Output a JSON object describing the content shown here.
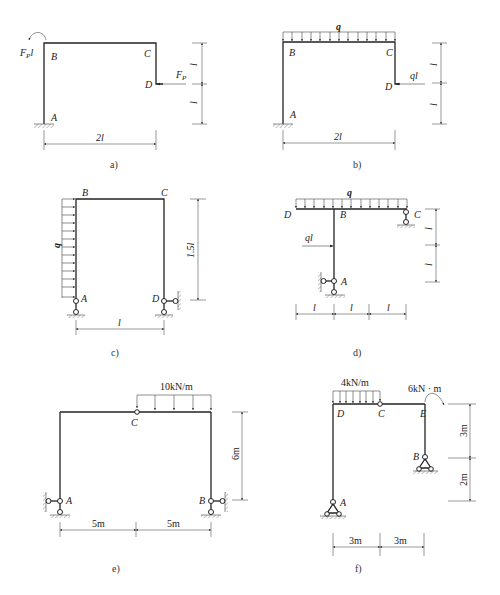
{
  "figures": [
    {
      "id": "a",
      "caption": "a)",
      "nodes": {
        "A": "A",
        "B": "B",
        "C": "C",
        "D": "D"
      },
      "loads": {
        "moment": "FPl",
        "moment_main": "F",
        "moment_sub": "P",
        "moment_tail": "l",
        "force_main": "F",
        "force_sub": "P"
      },
      "dims": {
        "horizontal": "2l",
        "vertical_upper": "l",
        "vertical_lower": "l"
      }
    },
    {
      "id": "b",
      "caption": "b)",
      "nodes": {
        "A": "A",
        "B": "B",
        "C": "C",
        "D": "D"
      },
      "loads": {
        "distributed": "q",
        "force": "ql"
      },
      "dims": {
        "horizontal": "2l",
        "vertical_upper": "l",
        "vertical_lower": "l"
      }
    },
    {
      "id": "c",
      "caption": "c)",
      "nodes": {
        "A": "A",
        "B": "B",
        "C": "C",
        "D": "D"
      },
      "loads": {
        "distributed": "q"
      },
      "dims": {
        "horizontal": "l",
        "vertical": "1.5l"
      }
    },
    {
      "id": "d",
      "caption": "d)",
      "nodes": {
        "A": "A",
        "B": "B",
        "C": "C",
        "D": "D"
      },
      "loads": {
        "distributed": "q",
        "force": "ql"
      },
      "dims": {
        "horizontal": [
          "l",
          "l",
          "l"
        ],
        "vertical_upper": "l",
        "vertical_lower": "l"
      }
    },
    {
      "id": "e",
      "caption": "e)",
      "nodes": {
        "A": "A",
        "B": "B",
        "C": "C"
      },
      "loads": {
        "distributed": "10kN/m"
      },
      "dims": {
        "horizontal": [
          "5m",
          "5m"
        ],
        "vertical": "6m"
      }
    },
    {
      "id": "f",
      "caption": "f)",
      "nodes": {
        "A": "A",
        "B": "B",
        "C": "C",
        "D": "D",
        "E": "E"
      },
      "loads": {
        "distributed": "4kN/m",
        "moment": "6kN · m"
      },
      "dims": {
        "horizontal": [
          "3m",
          "3m"
        ],
        "vertical_upper": "3m",
        "vertical_lower": "2m"
      }
    }
  ]
}
